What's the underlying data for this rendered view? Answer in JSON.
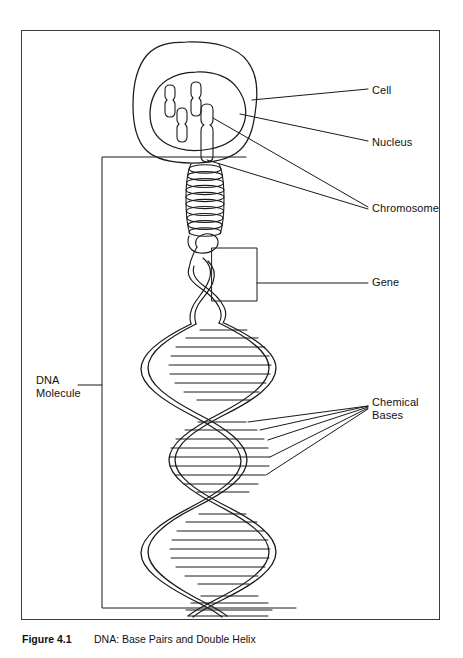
{
  "figure": {
    "caption_number": "Figure 4.1",
    "caption_text": "DNA: Base Pairs and Double Helix",
    "frame_color": "#3b3b3b",
    "line_color": "#1a1a1a"
  },
  "labels": {
    "cell": "Cell",
    "nucleus": "Nucleus",
    "chromosome": "Chromosome",
    "gene": "Gene",
    "chemical_bases": "Chemical\nBases",
    "dna_molecule": "DNA\nMolecule"
  },
  "diagram": {
    "type": "biological-schematic",
    "parts": [
      {
        "name": "cell-membrane",
        "shape": "rounded-blob",
        "description": "Outer cell boundary drawn as an irregular rounded square"
      },
      {
        "name": "nucleus",
        "shape": "rounded-blob",
        "description": "Inner organelle containing chromosomes"
      },
      {
        "name": "chromosomes",
        "count": 4,
        "shape": "rod-with-centromere",
        "description": "Four condensed chromosomes inside the nucleus"
      },
      {
        "name": "condensed-coil",
        "shape": "tight-helix",
        "turns": 11,
        "description": "Tightly coiled chromatin unwinding from the chromosome"
      },
      {
        "name": "gene-box",
        "shape": "rectangle",
        "description": "Rectangle highlighting a gene segment of the DNA strand"
      },
      {
        "name": "double-helix",
        "shape": "double-helix",
        "turns": 5,
        "rungs_per_turn": 7,
        "description": "DNA double helix with horizontal base-pair rungs"
      },
      {
        "name": "dna-molecule-bracket",
        "shape": "open-rectangle",
        "description": "Large rectangle bracketing the whole DNA molecule"
      }
    ],
    "leader_lines": [
      {
        "target": "cell-membrane",
        "label": "cell",
        "count": 1
      },
      {
        "target": "nucleus",
        "label": "nucleus",
        "count": 1
      },
      {
        "target": "chromosome",
        "label": "chromosome",
        "count": 2
      },
      {
        "target": "gene-box",
        "label": "gene",
        "count": 1
      },
      {
        "target": "base-pairs",
        "label": "chemical_bases",
        "count": 5
      },
      {
        "target": "dna-molecule-bracket",
        "label": "dna_molecule",
        "count": 1
      }
    ]
  }
}
